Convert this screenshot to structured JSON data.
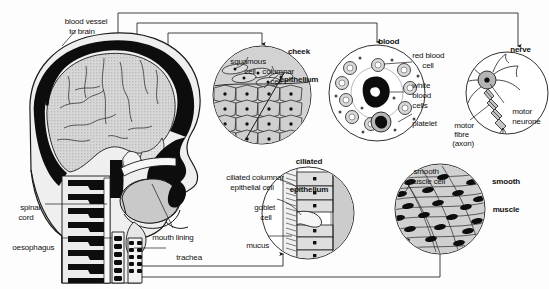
{
  "figure": {
    "background_color": "#fdfdfd",
    "line_color": "#1a1a1a",
    "tissue_fill": "#c9c9c9",
    "nucleus_color": "#101010"
  },
  "body_labels": {
    "blood_vessel": "blood vessel\nto brain",
    "spinal_cord": "spinal\ncord",
    "oesophagus": "oesophagus",
    "mouth_lining": "mouth lining",
    "trachea": "trachea"
  },
  "insets": [
    {
      "id": "cheek-epithelium",
      "title": "cheek\nepithelium",
      "labels": [
        "squamous",
        "cell",
        "columnar",
        "cell"
      ]
    },
    {
      "id": "blood",
      "title": "blood",
      "labels": [
        "red blood",
        "cell",
        "white",
        "blood",
        "cells",
        "platelet"
      ]
    },
    {
      "id": "nerve",
      "title": "nerve",
      "labels": [
        "motor",
        "neurone",
        "motor",
        "fibre",
        "(axon)"
      ]
    },
    {
      "id": "ciliated-epithelium",
      "title": "ciliated\nepithelium",
      "labels": [
        "ciliated columnar",
        "epithelial cell",
        "goblet",
        "cell",
        "mucus"
      ]
    },
    {
      "id": "smooth-muscle",
      "title": "smooth\nmuscle",
      "labels": [
        "smooth",
        "muscle cell"
      ]
    }
  ],
  "inset_text": {
    "cheek_title_line1": "cheek",
    "cheek_title_line2": "epithelium",
    "squamous": "squamous",
    "squamous_cell": "cell",
    "columnar": "columnar",
    "columnar_cell": "cell",
    "blood_title": "blood",
    "red_blood": "red blood",
    "red_blood_cell": "cell",
    "white": "white",
    "white_blood": "blood",
    "white_cells": "cells",
    "platelet": "platelet",
    "nerve_title": "nerve",
    "motor": "motor",
    "neurone": "neurone",
    "motor_fibre_1": "motor",
    "motor_fibre_2": "fibre",
    "motor_fibre_3": "(axon)",
    "ciliated_title_1": "ciliated",
    "ciliated_title_2": "epithelium",
    "ciliated_columnar": "ciliated columnar",
    "epithelial_cell": "epithelial cell",
    "goblet": "goblet",
    "goblet_cell": "cell",
    "mucus": "mucus",
    "smooth_title_1": "smooth",
    "smooth_title_2": "muscle",
    "smooth_cell_1": "smooth",
    "smooth_cell_2": "muscle cell"
  }
}
